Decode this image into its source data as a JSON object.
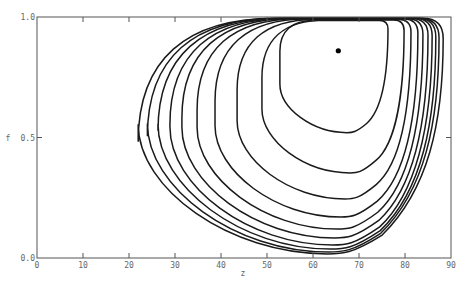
{
  "chart_data": {
    "type": "line",
    "title": "",
    "xlabel": "z",
    "ylabel": "f",
    "xlim": [
      0,
      90
    ],
    "ylim": [
      0.0,
      1.0
    ],
    "grid": false,
    "x_ticks": [
      0,
      10,
      20,
      30,
      40,
      50,
      60,
      70,
      80,
      90
    ],
    "x_tick_labels": [
      "0",
      "10",
      "20",
      "30",
      "40",
      "50",
      "60",
      "70",
      "80",
      "90"
    ],
    "y_ticks": [
      0.0,
      0.5,
      1.0
    ],
    "y_tick_labels": [
      "0.0",
      "0.5",
      "1.0"
    ],
    "equilibrium_point": {
      "z": 65.5,
      "f": 0.86
    },
    "series": [
      {
        "name": "contour-1",
        "z_min": 22.0,
        "z_max": 88.3,
        "f_min": 0.017,
        "f_max": 0.995
      },
      {
        "name": "contour-2",
        "z_min": 24.0,
        "z_max": 87.4,
        "f_min": 0.025,
        "f_max": 0.995
      },
      {
        "name": "contour-3",
        "z_min": 26.3,
        "z_max": 86.7,
        "f_min": 0.037,
        "f_max": 0.995
      },
      {
        "name": "contour-4",
        "z_min": 28.9,
        "z_max": 85.9,
        "f_min": 0.054,
        "f_max": 0.995
      },
      {
        "name": "contour-5",
        "z_min": 31.5,
        "z_max": 85.0,
        "f_min": 0.083,
        "f_max": 0.994
      },
      {
        "name": "contour-6",
        "z_min": 34.8,
        "z_max": 83.9,
        "f_min": 0.12,
        "f_max": 0.993
      },
      {
        "name": "contour-7",
        "z_min": 38.7,
        "z_max": 82.8,
        "f_min": 0.17,
        "f_max": 0.992
      },
      {
        "name": "contour-8",
        "z_min": 43.5,
        "z_max": 81.3,
        "f_min": 0.245,
        "f_max": 0.99
      },
      {
        "name": "contour-9",
        "z_min": 48.9,
        "z_max": 79.8,
        "f_min": 0.353,
        "f_max": 0.988
      },
      {
        "name": "contour-10",
        "z_min": 52.8,
        "z_max": 76.3,
        "f_min": 0.52,
        "f_max": 0.985
      }
    ]
  }
}
